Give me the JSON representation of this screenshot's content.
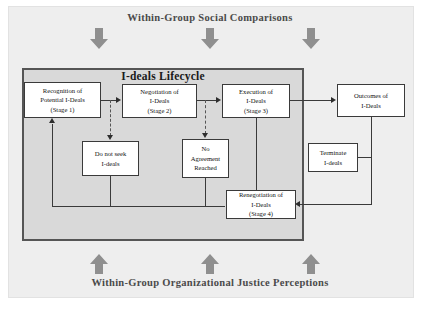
{
  "diagram": {
    "top_banner": "Within-Group Social Comparisons",
    "bottom_banner": "Within-Group Organizational Justice Perceptions",
    "lifecycle_title": "I-deals Lifecycle",
    "nodes": {
      "stage1": "Recognition of\nPotential I-Deals\n(Stage 1)",
      "stage1_l1": "Recognition of",
      "stage1_l2": "Potential I-Deals",
      "stage1_l3": "(Stage 1)",
      "stage2_l1": "Negotiation of",
      "stage2_l2": "I-Deals",
      "stage2_l3": "(Stage 2)",
      "stage3_l1": "Execution of",
      "stage3_l2": "I-Deals",
      "stage3_l3": "(Stage 3)",
      "outcomes_l1": "Outcomes of",
      "outcomes_l2": "I-Deals",
      "donotseek_l1": "Do not seek",
      "donotseek_l2": "I-deals",
      "noagreement_l1": "No",
      "noagreement_l2": "Agreement",
      "noagreement_l3": "Reached",
      "terminate_l1": "Terminate",
      "terminate_l2": "I-deals",
      "stage4_l1": "Renegotiation of",
      "stage4_l2": "I-Deals",
      "stage4_l3": "(Stage 4)"
    },
    "colors": {
      "panel_bg": "#eeeeee",
      "lifecycle_bg": "#d9d9d9",
      "node_bg": "#ffffff",
      "line": "#3a3a3a",
      "block_arrow": "#8f8f8f",
      "banner_text": "#4a4a4a"
    }
  }
}
